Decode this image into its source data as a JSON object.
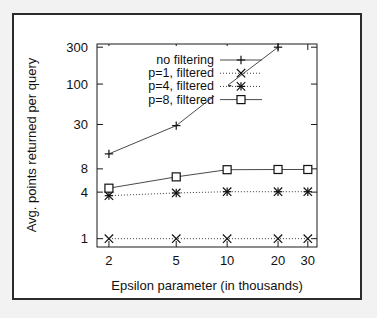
{
  "figure": {
    "background_color": "#f2f2f2",
    "plot_background": "#ffffff",
    "frame_color": "#2b2b2b"
  },
  "chart_data": {
    "type": "line",
    "title": "",
    "xlabel": "Epsilon parameter (in thousands)",
    "ylabel": "Avg. points returned per query",
    "xscale": "log",
    "yscale": "log",
    "grid": false,
    "legend_position": "top-left-inside",
    "x": [
      2,
      5,
      10,
      20,
      30
    ],
    "xticks": [
      2,
      5,
      10,
      20,
      30
    ],
    "xticklabels": [
      "2",
      "5",
      "10",
      "20",
      "30"
    ],
    "xlim": [
      1.7,
      34
    ],
    "yticks": [
      1,
      4,
      8,
      30,
      100,
      300
    ],
    "yticklabels": [
      "1",
      "4",
      "8",
      "30",
      "100",
      "300"
    ],
    "ylim": [
      0.78,
      330
    ],
    "series": [
      {
        "name": "no filtering",
        "marker": "plus",
        "linestyle": "solid",
        "x": [
          2,
          5,
          10,
          20
        ],
        "values": [
          12.5,
          29,
          95,
          300
        ]
      },
      {
        "name": "p=1, filtered",
        "marker": "cross",
        "linestyle": "dotted",
        "x": [
          2,
          5,
          10,
          20,
          30
        ],
        "values": [
          1,
          1,
          1,
          1,
          1
        ]
      },
      {
        "name": "p=4, filtered",
        "marker": "star",
        "linestyle": "dotted",
        "x": [
          2,
          5,
          10,
          20,
          30
        ],
        "values": [
          3.6,
          3.9,
          4.05,
          4.05,
          4.05
        ]
      },
      {
        "name": "p=8, filtered",
        "marker": "square",
        "linestyle": "solid",
        "x": [
          2,
          5,
          10,
          20,
          30
        ],
        "values": [
          4.5,
          6.3,
          7.8,
          7.85,
          7.85
        ]
      }
    ]
  },
  "legend": {
    "entries": [
      {
        "label": "no filtering",
        "marker": "plus",
        "linestyle": "solid"
      },
      {
        "label": "p=1, filtered",
        "marker": "cross",
        "linestyle": "dotted"
      },
      {
        "label": "p=4, filtered",
        "marker": "star",
        "linestyle": "dotted"
      },
      {
        "label": "p=8, filtered",
        "marker": "square",
        "linestyle": "solid"
      }
    ]
  }
}
